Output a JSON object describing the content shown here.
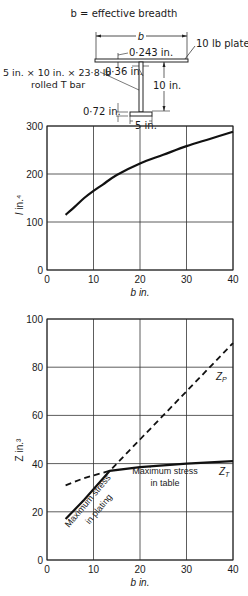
{
  "diagram": {
    "title": "b = effective breadth",
    "breadth_label": "b",
    "plate_label": "10 lb plate",
    "plate_thickness": "0·243 in.",
    "web_thickness": "0·36 in.",
    "tbar_label_line1": "5 in. × 10 in. × 23·8 lb",
    "tbar_label_line2": "rolled T bar",
    "depth_label": "10 in.",
    "flange_thickness": "0·72 in.",
    "flange_width": "5 in."
  },
  "chart_data": [
    {
      "type": "line",
      "title": "",
      "xlabel": "b in.",
      "ylabel": "I in.⁴",
      "xlim": [
        0,
        40
      ],
      "ylim": [
        0,
        300
      ],
      "xticks": [
        "0",
        "10",
        "20",
        "30",
        "40"
      ],
      "yticks": [
        "0",
        "100",
        "200",
        "300"
      ],
      "grid": true,
      "series": [
        {
          "name": "I",
          "style": "solid",
          "x": [
            4,
            6,
            8,
            10,
            12,
            15,
            20,
            25,
            30,
            35,
            40
          ],
          "y": [
            115,
            132,
            150,
            165,
            178,
            198,
            222,
            240,
            258,
            273,
            288
          ]
        }
      ]
    },
    {
      "type": "line",
      "title": "",
      "xlabel": "b in.",
      "ylabel": "Z in.³",
      "xlim": [
        0,
        40
      ],
      "ylim": [
        0,
        100
      ],
      "xticks": [
        "0",
        "10",
        "20",
        "30",
        "40"
      ],
      "yticks": [
        "0",
        "20",
        "40",
        "60",
        "80",
        "100"
      ],
      "grid": true,
      "series": [
        {
          "name": "Zₚ",
          "style": "dashed",
          "x": [
            4,
            8,
            13.5,
            20,
            30,
            40
          ],
          "y": [
            31,
            34,
            37,
            50,
            70,
            90
          ]
        },
        {
          "name": "Z_T",
          "style": "solid",
          "x": [
            4,
            8,
            13.5,
            20,
            30,
            40
          ],
          "y": [
            17,
            25,
            37,
            38.5,
            40,
            41
          ]
        }
      ],
      "annotations": [
        {
          "text": "Maximum stress",
          "sub": "in plating",
          "region": "b < 13.5"
        },
        {
          "text": "Maximum stress",
          "sub": "in table",
          "region": "b > 13.5"
        },
        {
          "text": "Zₚ",
          "at": [
            38,
            81
          ]
        },
        {
          "text": "Z_T",
          "at": [
            38,
            39
          ]
        }
      ]
    }
  ],
  "labels": {
    "chart1_x": "b in.",
    "chart1_y_var": "I",
    "chart1_y_unit": " in.⁴",
    "chart2_x": "b in.",
    "chart2_y": "Z in.³",
    "zp": "Z",
    "zp_sub": "P",
    "zt": "Z",
    "zt_sub": "T",
    "plating_line1": "Maximum stress",
    "plating_line2": "in plating",
    "table_line1": "Maximum stress",
    "table_line2": "in table"
  }
}
